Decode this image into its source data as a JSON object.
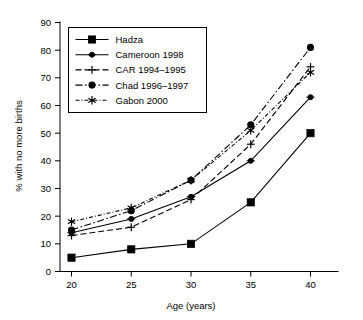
{
  "chart_data": {
    "type": "line",
    "title": "",
    "xlabel": "Age (years)",
    "ylabel": "% with no more births",
    "x": [
      20,
      25,
      30,
      35,
      40
    ],
    "xtick_labels": [
      "20",
      "25",
      "30",
      "35",
      "40"
    ],
    "ytick_labels": [
      "0",
      "10",
      "20",
      "30",
      "40",
      "50",
      "60",
      "70",
      "80",
      "90"
    ],
    "yticks": [
      0,
      10,
      20,
      30,
      40,
      50,
      60,
      70,
      80,
      90
    ],
    "xlim": [
      18,
      42
    ],
    "ylim": [
      0,
      90
    ],
    "grid": false,
    "legend_position": "top-left",
    "series": [
      {
        "name": "Hadza",
        "values": [
          5,
          8,
          10,
          25,
          50
        ],
        "marker": "filled-square",
        "dash": "solid"
      },
      {
        "name": "Cameroon 1998",
        "values": [
          14,
          19,
          27,
          40,
          63
        ],
        "marker": "filled-circle",
        "dash": "solid"
      },
      {
        "name": "CAR 1994–1995",
        "values": [
          13,
          16,
          26,
          46,
          74
        ],
        "marker": "plus",
        "dash": "dashed"
      },
      {
        "name": "Chad 1996–1997",
        "values": [
          15,
          22,
          33,
          53,
          81
        ],
        "marker": "circle-dot",
        "dash": "dash-dot"
      },
      {
        "name": "Gabon 2000",
        "values": [
          18,
          23,
          33,
          51,
          72
        ],
        "marker": "star",
        "dash": "dash-dot-fine"
      }
    ]
  },
  "colors": {
    "ink": "#000000",
    "paper": "#ffffff"
  }
}
